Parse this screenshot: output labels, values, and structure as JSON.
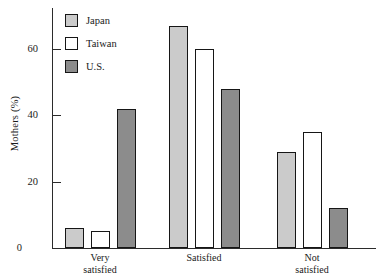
{
  "chart_data": {
    "type": "bar",
    "title": "",
    "xlabel": "",
    "ylabel": "Mothers (%)",
    "categories": [
      "Very\nsatisfied",
      "Satisfied",
      "Not\nsatisfied"
    ],
    "series": [
      {
        "name": "Japan",
        "values": [
          6,
          67,
          29
        ],
        "color": "#cbcbcb"
      },
      {
        "name": "Taiwan",
        "values": [
          5,
          60,
          35
        ],
        "color": "#ffffff"
      },
      {
        "name": "U.S.",
        "values": [
          42,
          48,
          12
        ],
        "color": "#8c8c8c"
      }
    ],
    "ylim": [
      0,
      72
    ],
    "yticks": [
      0,
      20,
      40,
      60
    ],
    "ytick_labels": [
      "0",
      "20",
      "40",
      "60"
    ],
    "grid": false,
    "legend_position": "top-left",
    "bar_edge_color": "#161616"
  },
  "axis": {
    "y_title": "Mothers (%)"
  },
  "legend": {
    "items": [
      {
        "label": "Japan"
      },
      {
        "label": "Taiwan"
      },
      {
        "label": "U.S."
      }
    ]
  }
}
